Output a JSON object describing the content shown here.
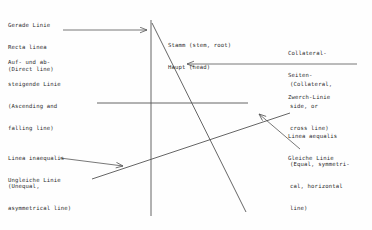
{
  "figure": {
    "stroke_color": "#555555",
    "text_color": "#2b2b2b",
    "background_color": "#fefefe",
    "labels": {
      "gerade_linie": {
        "lines": [
          "Gerade Linie",
          "Recta linea",
          "(Direct line)"
        ]
      },
      "auf_und_absteigende": {
        "lines": [
          "Auf- und ab-",
          "steigende Linie",
          "(Ascending and",
          "falling line)"
        ]
      },
      "linea_inaequalis": {
        "lines": [
          "Linea inaequalis",
          "Ungleiche Linie"
        ]
      },
      "unequal_paren": {
        "lines": [
          "(Unequal,",
          "asymmetrical line)"
        ]
      },
      "stamm_haupt": {
        "lines": [
          "Stamm (stem, root)",
          "Haupt (head)"
        ]
      },
      "collateral": {
        "lines": [
          "Collateral-",
          "Seiten-",
          "Zwerch-Linie"
        ]
      },
      "collateral_paren": {
        "lines": [
          "(Collateral,",
          "side, or",
          "cross line)"
        ]
      },
      "linea_aequalis": {
        "lines": [
          "Linea aequalis",
          "Gleiche Linie"
        ]
      },
      "equal_paren": {
        "lines": [
          "(Equal, symmetri-",
          "cal, horizontal",
          "line)"
        ]
      }
    },
    "strokes": {
      "vertical_stem": {
        "x1": 151,
        "y1": 20,
        "x2": 151,
        "y2": 216
      },
      "descending_diagonal": {
        "x1": 152,
        "y1": 23,
        "x2": 246,
        "y2": 212
      },
      "horizontal_collateral": {
        "x1": 97,
        "y1": 103,
        "x2": 248,
        "y2": 103
      },
      "ascending_diagonal": {
        "x1": 92,
        "y1": 179,
        "x2": 290,
        "y2": 113
      }
    },
    "arrows": {
      "arrow_direct_line": {
        "x1": 63,
        "y1": 30,
        "x2": 148,
        "y2": 30,
        "dir": "right"
      },
      "arrow_collateral": {
        "x1": 357,
        "y1": 64,
        "x2": 186,
        "y2": 64,
        "dir": "left"
      },
      "arrow_inequal": {
        "x1": 60,
        "y1": 159,
        "x2": 124,
        "y2": 166,
        "dir": "right-down"
      },
      "arrow_equal": {
        "x1": 300,
        "y1": 148,
        "x2": 258,
        "y2": 113,
        "dir": "left-up"
      }
    }
  }
}
